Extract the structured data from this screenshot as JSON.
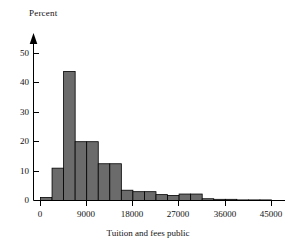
{
  "figure": {
    "type": "histogram",
    "y_axis_title": "Percent",
    "x_axis_title": "Tuition and fees public",
    "y_ticks": [
      "0",
      "10",
      "20",
      "30",
      "40",
      "50"
    ],
    "x_ticks": [
      "0",
      "9000",
      "18000",
      "27000",
      "36000",
      "45000"
    ],
    "bar_color": "#6b6b6b",
    "bar_edge_color": "#000000",
    "axis_color": "#000000",
    "background_color": "#ffffff"
  },
  "chart_data": {
    "type": "bar",
    "title": "",
    "subtitle": "",
    "xlabel": "Tuition and fees public",
    "ylabel": "Percent",
    "xlim": [
      0,
      46000
    ],
    "ylim": [
      0,
      54
    ],
    "xticks": [
      0,
      9000,
      18000,
      27000,
      36000,
      45000
    ],
    "yticks": [
      0,
      10,
      20,
      30,
      40,
      50
    ],
    "grid": false,
    "legend": "none",
    "bin_width": 2250,
    "bin_starts": [
      0,
      2250,
      4500,
      6750,
      9000,
      11250,
      13500,
      15750,
      18000,
      20250,
      22500,
      24750,
      27000,
      29250,
      31500,
      33750,
      36000,
      38250,
      40500,
      42750
    ],
    "values": [
      1.0,
      11.0,
      43.9,
      20.0,
      20.0,
      12.5,
      12.5,
      3.5,
      3.0,
      3.0,
      2.0,
      1.7,
      2.2,
      2.2,
      0.6,
      0.4,
      0.4,
      0.2,
      0.2,
      0.2
    ],
    "categories": [
      "0-2250",
      "2250-4500",
      "4500-6750",
      "6750-9000",
      "9000-11250",
      "11250-13500",
      "13500-15750",
      "15750-18000",
      "18000-20250",
      "20250-22500",
      "22500-24750",
      "24750-27000",
      "27000-29250",
      "29250-31500",
      "31500-33750",
      "33750-36000",
      "36000-38250",
      "38250-40500",
      "40500-42750",
      "42750-45000"
    ],
    "annotations": []
  }
}
